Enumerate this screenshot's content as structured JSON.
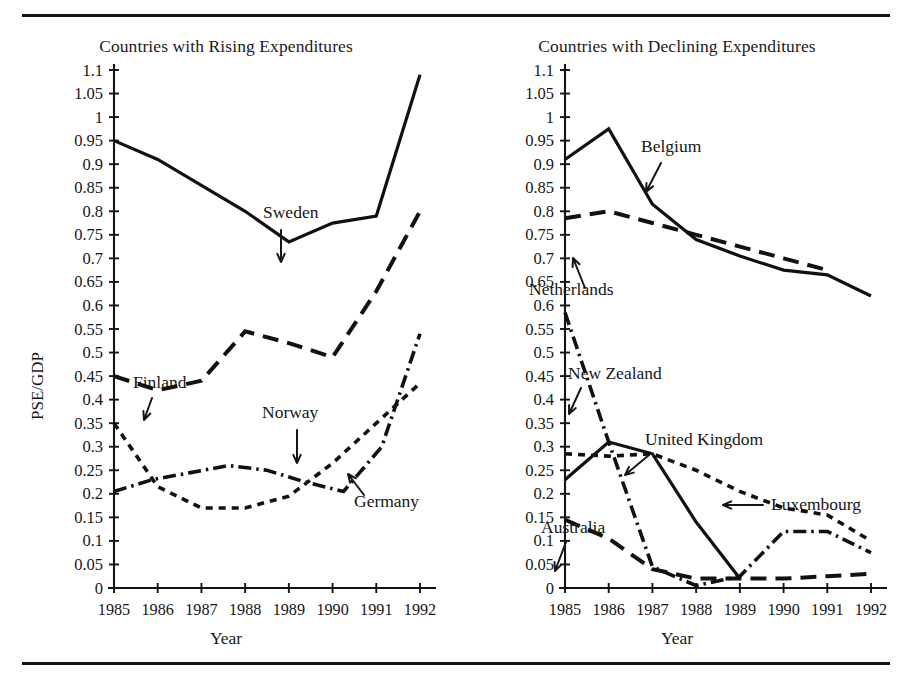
{
  "figure": {
    "rule_top": "horizontal-rule",
    "rule_bottom": "horizontal-rule"
  },
  "chart_data": [
    {
      "type": "line",
      "title": "Countries with Rising Expenditures",
      "xlabel": "Year",
      "ylabel": "PSE/GDP",
      "grid": false,
      "legend": "inline-annotations",
      "x": [
        1985,
        1986,
        1987,
        1988,
        1989,
        1990,
        1991,
        1992
      ],
      "xlim": [
        1985,
        1992
      ],
      "ylim": [
        0,
        1.1
      ],
      "xtick_labels": [
        "1985",
        "1986",
        "1987",
        "1988",
        "1989",
        "1990",
        "1991",
        "1992"
      ],
      "ytick_labels": [
        "1.1",
        "1.05",
        "1",
        "0.95",
        "0.9",
        "0.85",
        "0.8",
        "0.75",
        "0.7",
        "0.65",
        "0.6",
        "0.55",
        "0.5",
        "0.45",
        "0.4",
        "0.35",
        "0.3",
        "0.25",
        "0.2",
        "0.15",
        "0.1",
        "0.05",
        "0"
      ],
      "ytick_values": [
        1.1,
        1.05,
        1.0,
        0.95,
        0.9,
        0.85,
        0.8,
        0.75,
        0.7,
        0.65,
        0.6,
        0.55,
        0.5,
        0.45,
        0.4,
        0.35,
        0.3,
        0.25,
        0.2,
        0.15,
        0.1,
        0.05,
        0
      ],
      "series": [
        {
          "name": "Sweden",
          "style": "solid",
          "values": [
            0.95,
            0.91,
            0.855,
            0.8,
            0.735,
            0.775,
            0.79,
            1.09
          ]
        },
        {
          "name": "Finland",
          "style": "dashed-long",
          "values": [
            0.45,
            0.42,
            0.44,
            0.545,
            0.52,
            0.49,
            0.63,
            0.8
          ]
        },
        {
          "name": "Norway",
          "style": "dotted-short",
          "values": [
            0.35,
            0.215,
            0.17,
            0.17,
            0.195,
            0.265,
            0.35,
            0.435
          ]
        },
        {
          "name": "Germany",
          "style": "dash-dot",
          "values": [
            0.205,
            0.23,
            0.245,
            0.26,
            0.25,
            0.225,
            0.205,
            0.24
          ]
        }
      ],
      "germany_tail": [
        0.205,
        0.23,
        0.245,
        0.26,
        0.25,
        0.225,
        0.205,
        0.3,
        0.54
      ],
      "annotations": [
        {
          "label": "Sweden",
          "x": 263,
          "y": 198
        },
        {
          "label": "Finland",
          "x": 133,
          "y": 368
        },
        {
          "label": "Norway",
          "x": 262,
          "y": 398
        },
        {
          "label": "Germany",
          "x": 354,
          "y": 487
        }
      ]
    },
    {
      "type": "line",
      "title": "Countries with Declining Expenditures",
      "xlabel": "Year",
      "ylabel": "PSE/GDP",
      "grid": false,
      "legend": "inline-annotations",
      "x": [
        1985,
        1986,
        1987,
        1988,
        1989,
        1990,
        1991,
        1992
      ],
      "xlim": [
        1985,
        1992
      ],
      "ylim": [
        0,
        1.1
      ],
      "xtick_labels": [
        "1985",
        "1986",
        "1987",
        "1988",
        "1989",
        "1990",
        "1991",
        "1992"
      ],
      "ytick_labels": [
        "1.1",
        "1.05",
        "1",
        "0.95",
        "0.9",
        "0.85",
        "0.8",
        "0.75",
        "0.7",
        "0.65",
        "0.6",
        "0.55",
        "0.5",
        "0.45",
        "0.4",
        "0.35",
        "0.3",
        "0.25",
        "0.2",
        "0.15",
        "0.1",
        "0.05",
        "0"
      ],
      "ytick_values": [
        1.1,
        1.05,
        1.0,
        0.95,
        0.9,
        0.85,
        0.8,
        0.75,
        0.7,
        0.65,
        0.6,
        0.55,
        0.5,
        0.45,
        0.4,
        0.35,
        0.3,
        0.25,
        0.2,
        0.15,
        0.1,
        0.05,
        0
      ],
      "series": [
        {
          "name": "Belgium",
          "style": "solid",
          "values": [
            0.91,
            0.975,
            0.815,
            0.74,
            0.705,
            0.675,
            0.665,
            0.62
          ]
        },
        {
          "name": "Netherlands",
          "style": "dashed-long",
          "values": [
            0.785,
            0.8,
            0.775,
            0.75,
            0.725,
            0.7,
            0.675,
            null
          ]
        },
        {
          "name": "New Zealand",
          "style": "dash-dot",
          "values": [
            0.585,
            0.31,
            0.045,
            0.005,
            0.025,
            0.12,
            0.12,
            0.075
          ]
        },
        {
          "name": "United Kingdom",
          "style": "solid",
          "values": [
            0.23,
            0.31,
            0.285,
            0.14,
            0.02,
            null,
            null,
            null
          ]
        },
        {
          "name": "Luxembourg",
          "style": "dotted-short",
          "values": [
            0.285,
            0.28,
            0.285,
            0.25,
            0.205,
            0.17,
            0.155,
            0.1
          ]
        },
        {
          "name": "Australia",
          "style": "dashed-long",
          "values": [
            0.145,
            0.105,
            0.04,
            0.02,
            0.02,
            0.02,
            0.025,
            0.03
          ]
        }
      ],
      "annotations": [
        {
          "label": "Belgium",
          "x": 190,
          "y": 132
        },
        {
          "label": "Netherlands",
          "x": 78,
          "y": 275
        },
        {
          "label": "New Zealand",
          "x": 117,
          "y": 359
        },
        {
          "label": "United Kingdom",
          "x": 194,
          "y": 425
        },
        {
          "label": "Luxembourg",
          "x": 320,
          "y": 490
        },
        {
          "label": "Australia",
          "x": 90,
          "y": 513
        }
      ]
    }
  ]
}
